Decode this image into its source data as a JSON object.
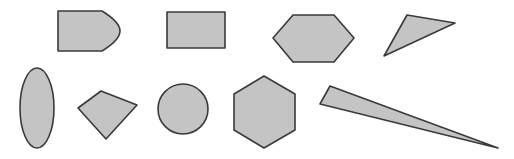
{
  "canvas": {
    "width": 514,
    "height": 159,
    "background": "#ffffff"
  },
  "style": {
    "fill": "#c4c4c4",
    "stroke": "#3a3a3a",
    "stroke_width": 1.6
  },
  "shapes": [
    {
      "id": "bullet",
      "kind": "path",
      "d": "M58,11 L102,11 Q120,22 120,31 Q120,40 102,51 L58,51 Z"
    },
    {
      "id": "rectangle",
      "kind": "rect",
      "x": 167,
      "y": 12,
      "width": 58,
      "height": 36
    },
    {
      "id": "hexagon-wide",
      "kind": "polygon",
      "points": "273,38 293,15 334,15 354,38 334,62 293,62"
    },
    {
      "id": "triangle",
      "kind": "polygon",
      "points": "407,15 455,23 384,56"
    },
    {
      "id": "ellipse",
      "kind": "ellipse",
      "cx": 37,
      "cy": 108,
      "rx": 17,
      "ry": 40
    },
    {
      "id": "kite",
      "kind": "polygon",
      "points": "78,108 101,91 137,105 106,139"
    },
    {
      "id": "circle",
      "kind": "circle",
      "cx": 183,
      "cy": 109,
      "r": 25
    },
    {
      "id": "hexagon-regular",
      "kind": "polygon",
      "points": "264,76 295,94 295,130 264,148 234,130 234,94"
    },
    {
      "id": "needle-triangle",
      "kind": "polygon",
      "points": "330,86 320,104 498,148"
    }
  ]
}
